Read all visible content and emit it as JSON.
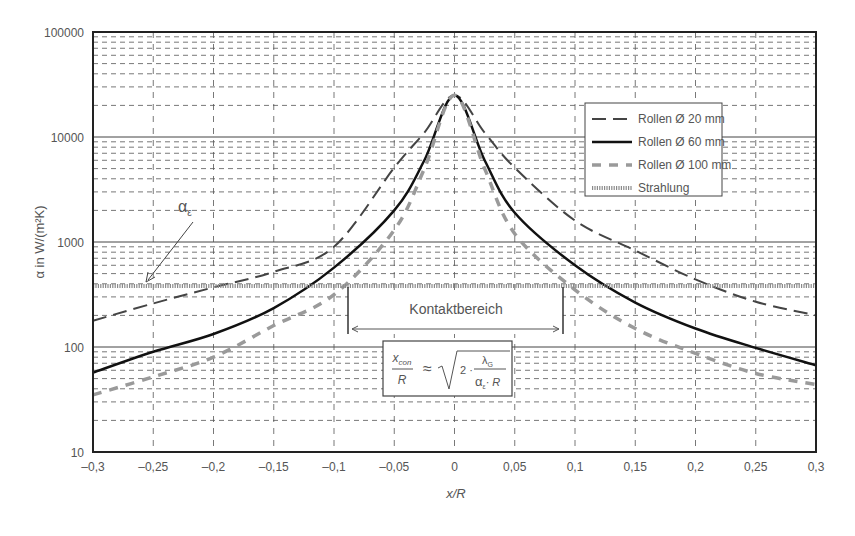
{
  "chart_data": {
    "type": "line",
    "title": "",
    "xlabel": "x/R",
    "ylabel": "α in W/(m²K)",
    "xlim": [
      -0.3,
      0.3
    ],
    "ylim": [
      10,
      100000
    ],
    "yscale": "log",
    "grid": true,
    "x_ticks": [
      "–0,3",
      "–0,25",
      "–0,2",
      "–0,15",
      "–0,1",
      "–0,05",
      "0",
      "0,05",
      "0,1",
      "0,15",
      "0,2",
      "0,25",
      "0,3"
    ],
    "y_ticks": [
      "10",
      "100",
      "1000",
      "10000",
      "100000"
    ],
    "legend_position": "upper right",
    "series": [
      {
        "name": "Rollen Ø 20 mm",
        "style": "dashed",
        "color": "#444444",
        "x": [
          -0.3,
          -0.25,
          -0.2,
          -0.15,
          -0.1,
          -0.05,
          -0.025,
          0,
          0.025,
          0.05,
          0.1,
          0.15,
          0.2,
          0.25,
          0.3
        ],
        "values": [
          178,
          260,
          370,
          520,
          900,
          5100,
          11000,
          25000,
          11000,
          5100,
          1600,
          830,
          440,
          270,
          200
        ]
      },
      {
        "name": "Rollen Ø 60 mm",
        "style": "solid",
        "color": "#111111",
        "x": [
          -0.3,
          -0.25,
          -0.2,
          -0.15,
          -0.1,
          -0.05,
          -0.025,
          0,
          0.025,
          0.05,
          0.1,
          0.15,
          0.2,
          0.25,
          0.3
        ],
        "values": [
          57,
          90,
          133,
          235,
          570,
          2000,
          6000,
          25000,
          6000,
          1900,
          600,
          265,
          150,
          98,
          67
        ]
      },
      {
        "name": "Rollen Ø 100 mm",
        "style": "dashed-grey",
        "color": "#9a9a9a",
        "x": [
          -0.3,
          -0.25,
          -0.2,
          -0.15,
          -0.1,
          -0.05,
          -0.025,
          0,
          0.025,
          0.05,
          0.1,
          0.15,
          0.2,
          0.25,
          0.3
        ],
        "values": [
          35,
          52,
          80,
          160,
          315,
          1300,
          5000,
          25000,
          5000,
          1200,
          350,
          150,
          87,
          56,
          44
        ]
      },
      {
        "name": "Strahlung",
        "style": "hatched",
        "color": "#888888",
        "x": [
          -0.3,
          0.3
        ],
        "values": [
          380,
          380
        ]
      }
    ],
    "annotations": [
      {
        "text": "α_ε",
        "points_to": "Strahlung line at x≈-0.26"
      },
      {
        "text": "Kontaktbereich",
        "x_range": [
          -0.09,
          0.09
        ]
      },
      {
        "text": "x_con/R ≈ √(2·λ_G/(α_ε·R))"
      }
    ]
  },
  "labels": {
    "alpha_eps": "α",
    "alpha_eps_sub": "ε",
    "contact": "Kontaktbereich",
    "formula_num": "x",
    "formula_num_sub": "con",
    "formula_den": "R",
    "formula_approx": "≈",
    "formula_two": "2 ·",
    "formula_lambda": "λ",
    "formula_lambda_sub": "G",
    "formula_alpha": "α",
    "formula_alpha_sub": "ε",
    "formula_r": "· R"
  }
}
